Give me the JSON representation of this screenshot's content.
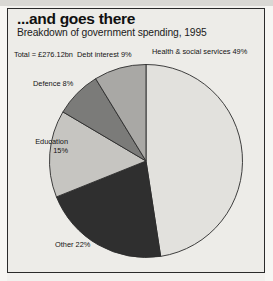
{
  "figure": {
    "title": "...and goes there",
    "subtitle": "Breakdown of government spending, 1995",
    "total_note": "Total = £276.12bn"
  },
  "labels": {
    "health": "Health & social services 49%",
    "other": "Other 22%",
    "education_name": "Education",
    "education_pct": "15%",
    "defence": "Defence 8%",
    "debt": "Debt interest 9%"
  },
  "chart_data": {
    "type": "pie",
    "title": "...and goes there",
    "subtitle": "Breakdown of government spending, 1995",
    "annotations": [
      "Total = £276.12bn"
    ],
    "unit": "percent of total government spending",
    "total": "£276.12bn",
    "start_angle_deg": 0,
    "direction": "clockwise",
    "legend": "none (direct labels)",
    "categories": [
      "Health & social services",
      "Other",
      "Education",
      "Defence",
      "Debt interest"
    ],
    "values": [
      49,
      22,
      15,
      8,
      9
    ],
    "labels": [
      "Health & social services 49%",
      "Other 22%",
      "Education 15%",
      "Defence 8%",
      "Debt interest 9%"
    ],
    "colors": [
      "#e2e1dd",
      "#2f2f2f",
      "#c6c5c1",
      "#7b7b79",
      "#a9a8a5"
    ],
    "slices": [
      {
        "name": "Health & social services",
        "value": 49,
        "color": "#e2e1dd"
      },
      {
        "name": "Other",
        "value": 22,
        "color": "#2f2f2f"
      },
      {
        "name": "Education",
        "value": 15,
        "color": "#c6c5c1"
      },
      {
        "name": "Defence",
        "value": 8,
        "color": "#7b7b79"
      },
      {
        "name": "Debt interest",
        "value": 9,
        "color": "#a9a8a5"
      }
    ]
  },
  "style": {
    "page_background": "#edece8",
    "border_color": "#2b2b2b",
    "text_color": "#131313"
  }
}
